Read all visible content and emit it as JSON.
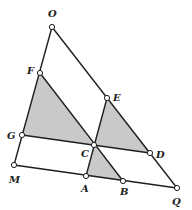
{
  "figure": {
    "type": "geometry-diagram",
    "colors": {
      "line": "#1e1e1e",
      "shade": "#c9c9c9",
      "point_fill": "#ffffff",
      "background": "#ffffff"
    },
    "points": {
      "O": {
        "label": "O",
        "x": 52,
        "y": 27,
        "lx": 48,
        "ly": 17
      },
      "F": {
        "label": "F",
        "x": 40,
        "y": 73,
        "lx": 27,
        "ly": 74
      },
      "G": {
        "label": "G",
        "x": 22,
        "y": 135,
        "lx": 7,
        "ly": 139
      },
      "M": {
        "label": "M",
        "x": 14,
        "y": 165,
        "lx": 9,
        "ly": 183
      },
      "E": {
        "label": "E",
        "x": 107,
        "y": 98,
        "lx": 113,
        "ly": 101
      },
      "D": {
        "label": "D",
        "x": 150,
        "y": 153,
        "lx": 156,
        "ly": 158
      },
      "Q": {
        "label": "Q",
        "x": 177,
        "y": 188,
        "lx": 172,
        "ly": 205
      },
      "C": {
        "label": "C",
        "x": 94,
        "y": 145,
        "lx": 81,
        "ly": 157
      },
      "A": {
        "label": "A",
        "x": 86,
        "y": 176,
        "lx": 81,
        "ly": 192
      },
      "B": {
        "label": "B",
        "x": 123,
        "y": 181,
        "lx": 120,
        "ly": 195
      }
    },
    "segments": [
      [
        "O",
        "M"
      ],
      [
        "O",
        "Q"
      ],
      [
        "M",
        "Q"
      ],
      [
        "G",
        "D"
      ],
      [
        "F",
        "B"
      ],
      [
        "E",
        "A"
      ]
    ],
    "shaded_triangles": [
      [
        "F",
        "G",
        "C"
      ],
      [
        "E",
        "C",
        "D"
      ],
      [
        "C",
        "A",
        "B"
      ]
    ]
  }
}
